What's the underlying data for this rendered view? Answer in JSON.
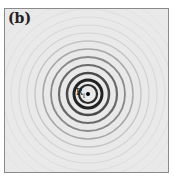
{
  "panel": {
    "label": "(b)"
  },
  "source": {
    "label": "R",
    "subscript": "I"
  },
  "rings": [
    {
      "r": 9,
      "w": 2.2,
      "c": "#2a2a2a"
    },
    {
      "r": 14,
      "w": 3.0,
      "c": "#222222"
    },
    {
      "r": 21,
      "w": 2.5,
      "c": "#4a4a4a"
    },
    {
      "r": 29,
      "w": 2.2,
      "c": "#6a6a6a"
    },
    {
      "r": 37,
      "w": 1.8,
      "c": "#8a8a8a"
    },
    {
      "r": 45,
      "w": 1.5,
      "c": "#a8a8a8"
    },
    {
      "r": 53,
      "w": 1.3,
      "c": "#c4c4c4"
    },
    {
      "r": 61,
      "w": 1.2,
      "c": "#d2d2d2"
    },
    {
      "r": 69,
      "w": 1.1,
      "c": "#d8d8d8"
    },
    {
      "r": 77,
      "w": 1.0,
      "c": "#dcdcdc"
    },
    {
      "r": 85,
      "w": 1.0,
      "c": "#dfdfdf"
    },
    {
      "r": 93,
      "w": 1.0,
      "c": "#e1e1e1"
    },
    {
      "r": 101,
      "w": 1.0,
      "c": "#e3e3e3"
    }
  ]
}
